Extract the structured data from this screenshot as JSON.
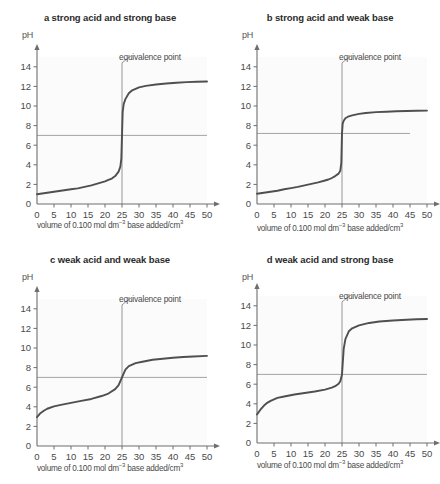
{
  "figure": {
    "xlabel_prefix": "volume of 0.100 mol dm",
    "xlabel_exponent": "−3",
    "xlabel_suffix": " base added/cm",
    "xlabel_suffix_exponent": "3",
    "ylabel": "pH",
    "annotation": "equivalence point",
    "curve_color": "#4f4f4f",
    "axis_color": "#6e6e6e",
    "reference_line_color": "#9a9a9a",
    "equivalence_line_color": "#8a8a8a",
    "plot_background": "#fbfbfb"
  },
  "chart_data": [
    {
      "type": "line",
      "title": "a strong acid and strong base",
      "xlabel": "volume of 0.100 mol dm−3 base added/cm3",
      "ylabel": "pH",
      "xlim": [
        0,
        50
      ],
      "ylim": [
        0,
        15
      ],
      "xticks": [
        0,
        5,
        10,
        15,
        20,
        25,
        30,
        35,
        40,
        45,
        50
      ],
      "yticks": [
        0,
        2,
        4,
        6,
        8,
        10,
        12,
        14
      ],
      "grid": false,
      "legend": "none",
      "annotations": [
        {
          "text": "equivalence point",
          "x": 25,
          "y": 14.4
        }
      ],
      "reference_line": {
        "y": 7,
        "x_from": 0,
        "x_to": 50
      },
      "equivalence_point": {
        "x": 25,
        "pH": 7
      },
      "x": [
        0,
        2,
        4,
        6,
        8,
        10,
        12,
        14,
        16,
        18,
        20,
        21,
        22,
        23,
        24,
        24.5,
        24.8,
        25,
        25.2,
        25.5,
        26,
        27,
        28,
        30,
        32,
        35,
        38,
        41,
        44,
        47,
        50
      ],
      "y": [
        1.0,
        1.1,
        1.2,
        1.3,
        1.4,
        1.5,
        1.6,
        1.75,
        1.9,
        2.1,
        2.3,
        2.45,
        2.6,
        2.85,
        3.3,
        3.8,
        4.6,
        7.0,
        9.4,
        10.2,
        10.7,
        11.3,
        11.6,
        11.9,
        12.05,
        12.2,
        12.3,
        12.38,
        12.44,
        12.48,
        12.5
      ]
    },
    {
      "type": "line",
      "title": "b strong acid and weak base",
      "xlabel": "volume of 0.100 mol dm−3 base added/cm3",
      "ylabel": "pH",
      "xlim": [
        0,
        50
      ],
      "ylim": [
        0,
        15
      ],
      "xticks": [
        0,
        5,
        10,
        15,
        20,
        25,
        30,
        35,
        40,
        45,
        50
      ],
      "yticks": [
        0,
        2,
        4,
        6,
        8,
        10,
        12,
        14
      ],
      "grid": false,
      "legend": "none",
      "annotations": [
        {
          "text": "equivalence point",
          "x": 25,
          "y": 14.4
        }
      ],
      "reference_line": {
        "y": 7.2,
        "x_from": 0,
        "x_to": 45
      },
      "equivalence_point": {
        "x": 25,
        "pH": 7.2
      },
      "x": [
        0,
        2,
        4,
        6,
        8,
        10,
        12,
        14,
        16,
        18,
        20,
        21,
        22,
        23,
        24,
        24.5,
        24.8,
        25,
        25.2,
        25.5,
        26,
        27,
        28,
        30,
        32,
        35,
        38,
        41,
        44,
        47,
        50
      ],
      "y": [
        1.05,
        1.15,
        1.25,
        1.35,
        1.5,
        1.62,
        1.75,
        1.9,
        2.05,
        2.2,
        2.4,
        2.5,
        2.65,
        2.85,
        3.1,
        3.4,
        4.2,
        7.2,
        8.2,
        8.5,
        8.75,
        8.95,
        9.05,
        9.2,
        9.28,
        9.37,
        9.42,
        9.46,
        9.49,
        9.51,
        9.53
      ]
    },
    {
      "type": "line",
      "title": "c weak acid and weak base",
      "xlabel": "volume of 0.100 mol dm−3 base added/cm3",
      "ylabel": "pH",
      "xlim": [
        0,
        50
      ],
      "ylim": [
        0,
        15
      ],
      "xticks": [
        0,
        5,
        10,
        15,
        20,
        25,
        30,
        35,
        40,
        45,
        50
      ],
      "yticks": [
        0,
        2,
        4,
        6,
        8,
        10,
        12,
        14
      ],
      "grid": false,
      "legend": "none",
      "annotations": [
        {
          "text": "equivalence point",
          "x": 25,
          "y": 14.4
        }
      ],
      "reference_line": {
        "y": 7,
        "x_from": 0,
        "x_to": 50
      },
      "equivalence_point": {
        "x": 25,
        "pH": 7
      },
      "x": [
        0,
        1,
        2,
        3,
        5,
        7,
        10,
        13,
        16,
        19,
        21,
        23,
        24,
        25,
        26,
        27,
        29,
        31,
        34,
        37,
        40,
        43,
        46,
        50
      ],
      "y": [
        2.95,
        3.35,
        3.6,
        3.8,
        4.05,
        4.2,
        4.4,
        4.6,
        4.8,
        5.1,
        5.35,
        5.8,
        6.2,
        7.0,
        7.8,
        8.15,
        8.45,
        8.6,
        8.8,
        8.9,
        9.0,
        9.08,
        9.14,
        9.2
      ]
    },
    {
      "type": "line",
      "title": "d weak acid and strong base",
      "xlabel": "volume of 0.100 mol dm−3 base added/cm3",
      "ylabel": "pH",
      "xlim": [
        0,
        50
      ],
      "ylim": [
        0,
        15
      ],
      "xticks": [
        0,
        5,
        10,
        15,
        20,
        25,
        30,
        35,
        40,
        45,
        50
      ],
      "yticks": [
        0,
        2,
        4,
        6,
        8,
        10,
        12,
        14
      ],
      "grid": false,
      "legend": "none",
      "annotations": [
        {
          "text": "equivalence point",
          "x": 25,
          "y": 14.4
        }
      ],
      "reference_line": {
        "y": 7,
        "x_from": 0,
        "x_to": 50
      },
      "equivalence_point": {
        "x": 25,
        "pH": 7
      },
      "x": [
        0,
        1,
        2,
        3,
        4,
        6,
        8,
        11,
        14,
        17,
        20,
        22,
        23,
        24,
        24.5,
        25,
        25.5,
        26,
        27,
        28,
        30,
        33,
        36,
        40,
        44,
        47,
        50
      ],
      "y": [
        2.9,
        3.4,
        3.8,
        4.1,
        4.3,
        4.6,
        4.75,
        4.95,
        5.1,
        5.25,
        5.45,
        5.65,
        5.8,
        6.05,
        6.3,
        7.0,
        9.6,
        10.6,
        11.4,
        11.7,
        12.0,
        12.25,
        12.4,
        12.5,
        12.58,
        12.62,
        12.66
      ]
    }
  ]
}
